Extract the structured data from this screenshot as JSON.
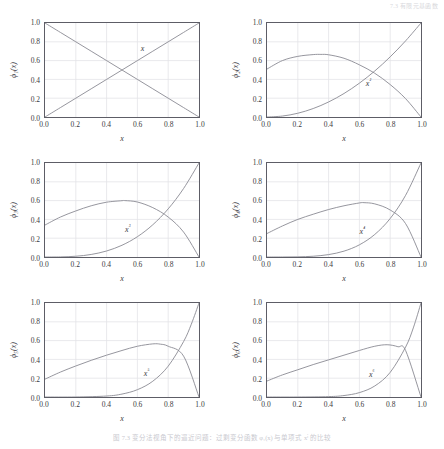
{
  "page_header": "7.3  有限元基函数",
  "caption": "图 7.3  变分法视角下的逼近问题：过剩变分函数 φ₁(x) 与单项式 xⁱ 的比较",
  "axis": {
    "x_label": "x",
    "x_ticks": [
      "0.0",
      "0.2",
      "0.4",
      "0.6",
      "0.8",
      "1.0"
    ],
    "y_ticks": [
      "0.0",
      "0.2",
      "0.4",
      "0.6",
      "0.8",
      "1.0"
    ],
    "xlim": [
      0.0,
      1.0
    ],
    "ylim": [
      0.0,
      1.0
    ]
  },
  "style": {
    "line_color": "#8a8a93",
    "frame_color": "#5d5d66",
    "grid_color": "#e3e3e8",
    "text_color": "#3a3a42",
    "background": "#ffffff"
  },
  "chart_data": {
    "type": "line",
    "title": "",
    "xlabel": "x",
    "ylabel": "phi_i(x)",
    "xlim": [
      0.0,
      1.0
    ],
    "ylim": [
      0.0,
      1.0
    ],
    "grid": true,
    "legend": "none",
    "panels": [
      {
        "index": 1,
        "ylabel": "ϕ₁(x)",
        "annotation": "x",
        "annotation_at": [
          0.62,
          0.72
        ],
        "series": [
          {
            "name": "x",
            "x": [
              0.0,
              0.1,
              0.2,
              0.3,
              0.4,
              0.5,
              0.6,
              0.7,
              0.8,
              0.9,
              1.0
            ],
            "values": [
              0.0,
              0.1,
              0.2,
              0.3,
              0.4,
              0.5,
              0.6,
              0.7,
              0.8,
              0.9,
              1.0
            ]
          },
          {
            "name": "phi_1",
            "x": [
              0.0,
              0.1,
              0.2,
              0.3,
              0.4,
              0.5,
              0.6,
              0.7,
              0.8,
              0.9,
              1.0
            ],
            "values": [
              1.0,
              0.9,
              0.8,
              0.7,
              0.6,
              0.5,
              0.4,
              0.3,
              0.2,
              0.1,
              0.0
            ]
          }
        ]
      },
      {
        "index": 2,
        "ylabel": "ϕ₂(x)",
        "annotation": "x²",
        "annotation_at": [
          0.64,
          0.38
        ],
        "series": [
          {
            "name": "x^2",
            "x": [
              0.0,
              0.1,
              0.2,
              0.3,
              0.4,
              0.5,
              0.6,
              0.7,
              0.8,
              0.9,
              1.0
            ],
            "values": [
              0.0,
              0.01,
              0.04,
              0.09,
              0.16,
              0.25,
              0.36,
              0.49,
              0.64,
              0.81,
              1.0
            ]
          },
          {
            "name": "phi_2",
            "x": [
              0.0,
              0.1,
              0.2,
              0.3,
              0.35,
              0.4,
              0.5,
              0.6,
              0.7,
              0.8,
              0.9,
              1.0
            ],
            "values": [
              0.51,
              0.6,
              0.645,
              0.664,
              0.666,
              0.662,
              0.625,
              0.555,
              0.465,
              0.345,
              0.195,
              0.0
            ]
          }
        ]
      },
      {
        "index": 3,
        "ylabel": "ϕ₃(x)",
        "annotation": "x³",
        "annotation_at": [
          0.52,
          0.31
        ],
        "series": [
          {
            "name": "x^3",
            "x": [
              0.0,
              0.1,
              0.2,
              0.3,
              0.4,
              0.5,
              0.6,
              0.7,
              0.8,
              0.9,
              1.0
            ],
            "values": [
              0.0,
              0.001,
              0.008,
              0.027,
              0.064,
              0.125,
              0.216,
              0.343,
              0.512,
              0.729,
              1.0
            ]
          },
          {
            "name": "phi_3",
            "x": [
              0.0,
              0.1,
              0.2,
              0.3,
              0.4,
              0.5,
              0.52,
              0.6,
              0.7,
              0.8,
              0.9,
              1.0
            ],
            "values": [
              0.34,
              0.425,
              0.49,
              0.545,
              0.583,
              0.599,
              0.6,
              0.585,
              0.525,
              0.425,
              0.265,
              0.0
            ]
          }
        ]
      },
      {
        "index": 4,
        "ylabel": "ϕ₄(x)",
        "annotation": "x⁴",
        "annotation_at": [
          0.6,
          0.29
        ],
        "series": [
          {
            "name": "x^4",
            "x": [
              0.0,
              0.1,
              0.2,
              0.3,
              0.4,
              0.5,
              0.6,
              0.7,
              0.8,
              0.9,
              1.0
            ],
            "values": [
              0.0,
              0.0001,
              0.0016,
              0.0081,
              0.0256,
              0.0625,
              0.1296,
              0.2401,
              0.4096,
              0.6561,
              1.0
            ]
          },
          {
            "name": "phi_4",
            "x": [
              0.0,
              0.1,
              0.2,
              0.3,
              0.4,
              0.5,
              0.6,
              0.63,
              0.7,
              0.8,
              0.9,
              1.0
            ],
            "values": [
              0.25,
              0.33,
              0.4,
              0.455,
              0.505,
              0.545,
              0.575,
              0.578,
              0.565,
              0.5,
              0.355,
              0.0
            ]
          }
        ]
      },
      {
        "index": 5,
        "ylabel": "ϕ₅(x)",
        "annotation": "x⁵",
        "annotation_at": [
          0.64,
          0.27
        ],
        "series": [
          {
            "name": "x^5",
            "x": [
              0.0,
              0.2,
              0.4,
              0.5,
              0.6,
              0.7,
              0.8,
              0.9,
              0.95,
              1.0
            ],
            "values": [
              0.0,
              0.0003,
              0.0102,
              0.0313,
              0.0778,
              0.168,
              0.328,
              0.59,
              0.774,
              1.0
            ]
          },
          {
            "name": "phi_5",
            "x": [
              0.0,
              0.1,
              0.2,
              0.3,
              0.4,
              0.5,
              0.6,
              0.7,
              0.75,
              0.8,
              0.9,
              1.0
            ],
            "values": [
              0.19,
              0.265,
              0.33,
              0.39,
              0.445,
              0.495,
              0.54,
              0.565,
              0.562,
              0.54,
              0.435,
              0.0
            ]
          }
        ]
      },
      {
        "index": 6,
        "ylabel": "ϕ₆(x)",
        "annotation": "x⁶",
        "annotation_at": [
          0.66,
          0.26
        ],
        "series": [
          {
            "name": "x^6",
            "x": [
              0.0,
              0.2,
              0.4,
              0.5,
              0.6,
              0.7,
              0.8,
              0.9,
              0.95,
              1.0
            ],
            "values": [
              0.0,
              6e-05,
              0.0041,
              0.0156,
              0.0467,
              0.1176,
              0.262,
              0.531,
              0.735,
              1.0
            ]
          },
          {
            "name": "phi_6",
            "x": [
              0.0,
              0.1,
              0.2,
              0.3,
              0.4,
              0.5,
              0.6,
              0.7,
              0.78,
              0.85,
              0.9,
              1.0
            ],
            "values": [
              0.17,
              0.235,
              0.29,
              0.345,
              0.395,
              0.445,
              0.495,
              0.54,
              0.556,
              0.535,
              0.495,
              0.0
            ]
          }
        ]
      }
    ]
  }
}
